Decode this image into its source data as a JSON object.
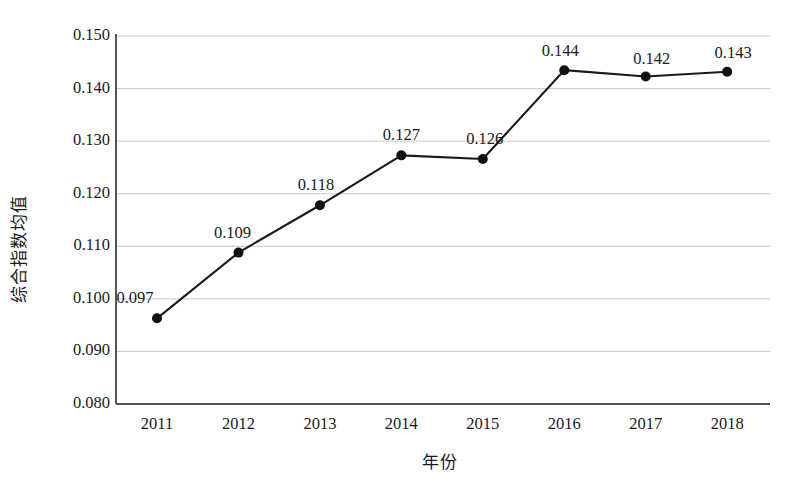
{
  "chart_data": {
    "type": "line",
    "title": "",
    "xlabel": "年份",
    "ylabel": "综合指数均值",
    "categories": [
      "2011",
      "2012",
      "2013",
      "2014",
      "2015",
      "2016",
      "2017",
      "2018"
    ],
    "values": [
      0.097,
      0.109,
      0.118,
      0.127,
      0.126,
      0.144,
      0.142,
      0.143
    ],
    "plotted_values": [
      0.0963,
      0.1088,
      0.1178,
      0.1273,
      0.1266,
      0.1435,
      0.1423,
      0.1432
    ],
    "point_labels": [
      "0.097",
      "0.109",
      "0.118",
      "0.127",
      "0.126",
      "0.144",
      "0.142",
      "0.143"
    ],
    "ylim": [
      0.08,
      0.15
    ],
    "ytick_labels": [
      "0.150",
      "0.140",
      "0.130",
      "0.120",
      "0.110",
      "0.100",
      "0.090",
      "0.080"
    ],
    "ytick_values": [
      0.15,
      0.14,
      0.13,
      0.12,
      0.11,
      0.1,
      0.09,
      0.08
    ],
    "grid": true,
    "legend": false,
    "series_name": "综合指数均值",
    "marker": "circle",
    "colors": {
      "line": "#1a1a1a",
      "marker": "#111111",
      "grid": "#c9c9c9",
      "axis": "#555555",
      "text": "#1a1a1a",
      "background": "#ffffff"
    }
  }
}
